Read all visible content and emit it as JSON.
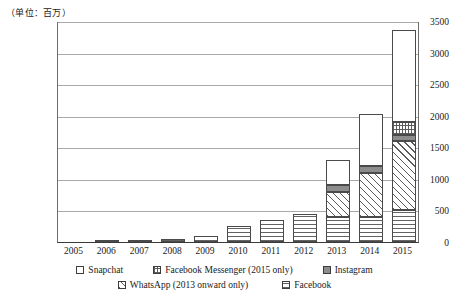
{
  "unit_note": "（单位：百万）",
  "legend": {
    "row1": [
      {
        "label": "Snapchat",
        "key": "snapchat"
      },
      {
        "label": "Facebook Messenger (2015 only)",
        "key": "messenger"
      },
      {
        "label": "Instagram",
        "key": "instagram"
      }
    ],
    "row2": [
      {
        "label": "WhatsApp (2013 onward only)",
        "key": "whatsapp"
      },
      {
        "label": "Facebook",
        "key": "facebook"
      }
    ]
  },
  "chart_data": {
    "type": "bar",
    "stacked": true,
    "title": "",
    "xlabel": "",
    "ylabel": "",
    "unit": "百万",
    "grid": true,
    "legend_position": "bottom",
    "ylim": [
      0,
      3500
    ],
    "yticks": [
      0,
      500,
      1000,
      1500,
      2000,
      2500,
      3000,
      3500
    ],
    "categories": [
      "2005",
      "2006",
      "2007",
      "2008",
      "2009",
      "2010",
      "2011",
      "2012",
      "2013",
      "2014",
      "2015"
    ],
    "series": [
      {
        "name": "Facebook",
        "key": "facebook",
        "values": [
          0,
          5,
          15,
          50,
          100,
          250,
          350,
          450,
          400,
          400,
          500
        ]
      },
      {
        "name": "WhatsApp (2013 onward only)",
        "key": "whatsapp",
        "values": [
          0,
          0,
          0,
          0,
          0,
          0,
          0,
          0,
          400,
          700,
          1100
        ]
      },
      {
        "name": "Instagram",
        "key": "instagram",
        "values": [
          0,
          0,
          0,
          0,
          0,
          0,
          0,
          0,
          100,
          100,
          100
        ]
      },
      {
        "name": "Facebook Messenger (2015 only)",
        "key": "messenger",
        "values": [
          0,
          0,
          0,
          0,
          0,
          0,
          0,
          0,
          0,
          0,
          200
        ]
      },
      {
        "name": "Snapchat",
        "key": "snapchat",
        "values": [
          0,
          0,
          0,
          0,
          0,
          0,
          0,
          0,
          400,
          830,
          1450
        ]
      }
    ],
    "totals": [
      0,
      5,
      15,
      50,
      100,
      250,
      350,
      450,
      1300,
      2030,
      3350
    ]
  }
}
